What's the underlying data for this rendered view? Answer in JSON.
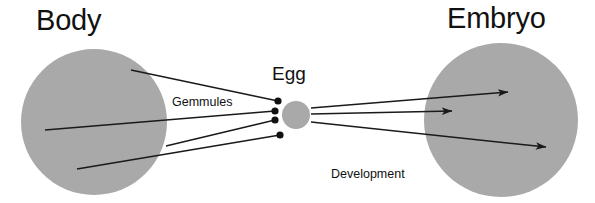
{
  "diagram": {
    "title_body": "Body",
    "title_egg": "Egg",
    "title_embryo": "Embryo",
    "label_gemmules": "Gemmules",
    "label_development_line1": "Development",
    "label_development_line2": "of Embryo",
    "colors": {
      "circle_fill": "#a9a9a9",
      "line_stroke": "#1a1a1a",
      "text": "#111111",
      "background": "#ffffff"
    },
    "shapes": {
      "body_circle": {
        "cx": 94,
        "cy": 122,
        "r": 73
      },
      "egg_circle": {
        "cx": 296,
        "cy": 115,
        "r": 14
      },
      "embryo_circle": {
        "cx": 501,
        "cy": 120,
        "r": 77
      }
    },
    "gemmule_dots": [
      {
        "cx": 278,
        "cy": 101,
        "r": 3.6
      },
      {
        "cx": 275,
        "cy": 111,
        "r": 3.6
      },
      {
        "cx": 275,
        "cy": 120,
        "r": 3.6
      },
      {
        "cx": 280,
        "cy": 135,
        "r": 3.6
      }
    ],
    "gemmule_lines": [
      {
        "x1": 131,
        "y1": 70,
        "x2": 278,
        "y2": 101
      },
      {
        "x1": 45,
        "y1": 130,
        "x2": 275,
        "y2": 111
      },
      {
        "x1": 166,
        "y1": 146,
        "x2": 275,
        "y2": 120
      },
      {
        "x1": 77,
        "y1": 169,
        "x2": 280,
        "y2": 135
      }
    ],
    "development_arrows": [
      {
        "x1": 311,
        "y1": 108,
        "x2": 508,
        "y2": 92
      },
      {
        "x1": 311,
        "y1": 114,
        "x2": 452,
        "y2": 111
      },
      {
        "x1": 311,
        "y1": 122,
        "x2": 546,
        "y2": 147
      }
    ]
  }
}
